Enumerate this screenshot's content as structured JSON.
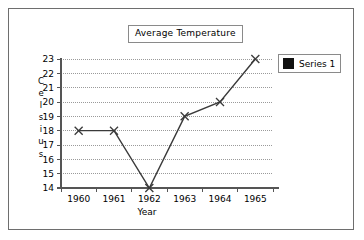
{
  "chart_data": {
    "type": "line",
    "title": "Average Temperature",
    "xlabel": "Year",
    "ylabel": "Celsius",
    "categories": [
      "1960",
      "1961",
      "1962",
      "1963",
      "1964",
      "1965"
    ],
    "series": [
      {
        "name": "Series 1",
        "values": [
          18,
          18,
          14,
          19,
          20,
          23
        ]
      }
    ],
    "yticks": [
      23,
      22,
      21,
      20,
      19,
      18,
      17,
      16,
      15,
      14
    ],
    "ylim": [
      14,
      23
    ],
    "grid": "horizontal-dotted",
    "legend_position": "right",
    "marker": "x-cross",
    "line_color": "#3a3a3a",
    "grid_color": "#9a9a9a",
    "axis_color": "#555555",
    "legend_swatch_color": "#111111"
  },
  "legend": {
    "entries": [
      {
        "label": "Series 1",
        "swatch": "legend-swatch-icon"
      }
    ]
  },
  "axis_titles": {
    "y_letters": [
      "C",
      "e",
      "l",
      "s",
      "i",
      "u",
      "s"
    ],
    "x": "Year"
  }
}
